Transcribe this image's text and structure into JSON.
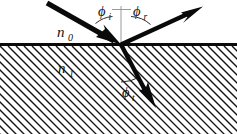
{
  "figure": {
    "type": "optics-ray-diagram",
    "width": 237,
    "height": 134,
    "background_color": "#ffffff",
    "ink_color": "#0a0a0a",
    "normal_color": "#9a9a9a"
  },
  "labels": {
    "angle_incidence": "ϕi",
    "angle_incidence_base": "ϕ",
    "angle_incidence_sub": "i",
    "angle_reflection": "ϕr",
    "angle_reflection_base": "ϕ",
    "angle_reflection_sub": "r",
    "angle_transmission": "ϕt",
    "angle_transmission_base": "ϕ",
    "angle_transmission_sub": "t",
    "index_upper": "n0",
    "index_upper_base": "n",
    "index_upper_sub": "0",
    "index_lower": "n1",
    "index_lower_base": "n",
    "index_lower_sub": "1"
  },
  "geometry": {
    "interface_y": 44.5,
    "origin_x": 121,
    "origin_y": 44.5,
    "normal_top_y": 6,
    "normal_tick_y": 9,
    "incident_start_x": 47,
    "incident_start_y": 3,
    "reflected_end_x": 202,
    "reflected_end_y": 7,
    "transmitted_end_x": 155,
    "transmitted_end_y": 108,
    "hatch_angle_deg": 45,
    "hatch_spacing": 7.5
  },
  "media": {
    "upper_label": "n0",
    "lower_label": "n1"
  }
}
